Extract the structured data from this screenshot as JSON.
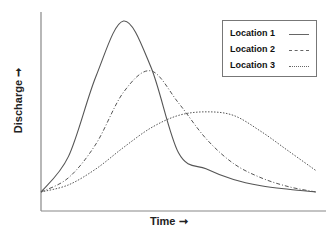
{
  "chart_data": {
    "type": "line",
    "title": "",
    "xlabel": "Time",
    "ylabel": "Discharge",
    "x_arrow": "→",
    "y_arrow": "→",
    "xlim": [
      0,
      10
    ],
    "ylim": [
      0,
      10
    ],
    "grid": false,
    "legend_position": "upper right",
    "x": [
      0,
      1,
      2,
      3,
      4,
      5,
      6,
      7,
      8,
      9,
      10
    ],
    "series": [
      {
        "name": "Location 1",
        "style": "solid",
        "values": [
          0.0,
          2.0,
          6.5,
          9.6,
          7.0,
          2.2,
          1.3,
          0.7,
          0.35,
          0.15,
          0.0
        ]
      },
      {
        "name": "Location 2",
        "style": "dash-dot",
        "values": [
          0.0,
          0.8,
          2.7,
          5.6,
          6.8,
          5.0,
          3.0,
          1.6,
          0.8,
          0.3,
          0.0
        ]
      },
      {
        "name": "Location 3",
        "style": "dotted",
        "values": [
          0.0,
          0.4,
          1.3,
          2.5,
          3.6,
          4.3,
          4.5,
          4.3,
          3.4,
          2.3,
          1.2
        ]
      }
    ]
  },
  "axes": {
    "ylabel_text": "Discharge ➞",
    "xlabel_text": "Time ➞"
  },
  "legend": {
    "items": [
      {
        "label": "Location 1",
        "style": "solid"
      },
      {
        "label": "Location 2",
        "style": "dash-dot"
      },
      {
        "label": "Location 3",
        "style": "dotted"
      }
    ]
  },
  "colors": {
    "line": "#555555",
    "axis": "#888888",
    "text": "#222222"
  }
}
